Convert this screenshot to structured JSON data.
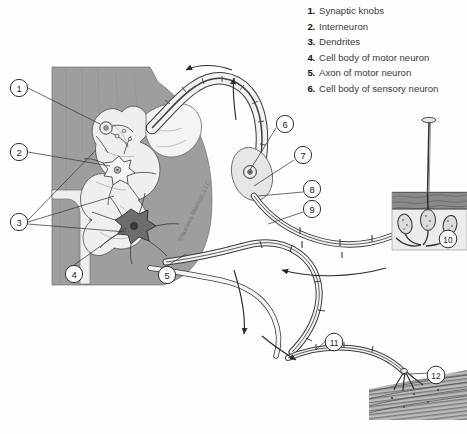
{
  "figure": {
    "watermark": "©Nucleus Medical, LLC"
  },
  "legend": {
    "items": [
      {
        "num": "1.",
        "label": "Synaptic knobs"
      },
      {
        "num": "2.",
        "label": "Interneuron"
      },
      {
        "num": "3.",
        "label": "Dendrites"
      },
      {
        "num": "4.",
        "label": "Cell body of motor neuron"
      },
      {
        "num": "5.",
        "label": "Axon of motor neuron"
      },
      {
        "num": "6.",
        "label": "Cell body of sensory neuron"
      }
    ]
  },
  "callouts": [
    {
      "id": "1",
      "label": "1",
      "cx": 19,
      "cy": 88
    },
    {
      "id": "2",
      "label": "2",
      "cx": 19,
      "cy": 152
    },
    {
      "id": "3",
      "label": "3",
      "cx": 19,
      "cy": 222
    },
    {
      "id": "4",
      "label": "4",
      "cx": 74,
      "cy": 274
    },
    {
      "id": "5",
      "label": "5",
      "cx": 167,
      "cy": 275
    },
    {
      "id": "6",
      "label": "6",
      "cx": 285,
      "cy": 124
    },
    {
      "id": "7",
      "label": "7",
      "cx": 303,
      "cy": 155
    },
    {
      "id": "8",
      "label": "8",
      "cx": 312,
      "cy": 189
    },
    {
      "id": "9",
      "label": "9",
      "cx": 312,
      "cy": 209
    },
    {
      "id": "10",
      "label": "10",
      "cx": 448,
      "cy": 239
    },
    {
      "id": "11",
      "label": "11",
      "cx": 334,
      "cy": 342
    },
    {
      "id": "12",
      "label": "12",
      "cx": 436,
      "cy": 375
    }
  ],
  "colors": {
    "white_matter": "#9e9e9e",
    "gray_matter": "#efefef",
    "background": "#fefefe",
    "outline": "#3a3a3a",
    "nerve": "#f4f4f4",
    "skin_upper": "#8a8a8a",
    "skin_lower": "#e8e8e8",
    "muscle": "#b8b8b8",
    "text": "#2b2b2b"
  },
  "structures": {
    "spinal_cord": "spinal cord cross-section",
    "tack": "tack piercing skin",
    "skin": "skin layers with sensory receptors",
    "muscle": "striated muscle fibers",
    "neuromuscular_junction": "motor end plate"
  }
}
